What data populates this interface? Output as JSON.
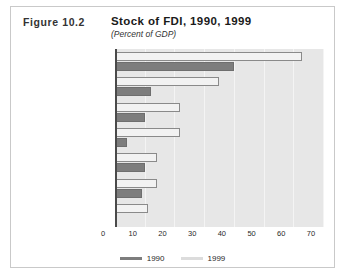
{
  "figure": {
    "number": "Figure 10.2",
    "title": "Stock of FDI, 1990, 1999",
    "subtitle": "(Percent of GDP)"
  },
  "legend": {
    "items": [
      {
        "label": "1990",
        "color": "#7d7d7d"
      },
      {
        "label": "1999",
        "color": "#dcdcdc"
      }
    ]
  },
  "axis": {
    "ticks": [
      "0",
      "10",
      "20",
      "30",
      "40",
      "50",
      "60",
      "70"
    ]
  },
  "chart_data": {
    "type": "bar",
    "orientation": "horizontal",
    "title": "Stock of FDI, 1990, 1999",
    "subtitle": "(Percent of GDP)",
    "xlabel": "",
    "ylabel": "",
    "xlim": [
      0,
      70
    ],
    "xticks": [
      0,
      10,
      20,
      30,
      40,
      50,
      60,
      70
    ],
    "grid": true,
    "legend_position": "bottom",
    "categories": [
      "East Asia",
      "Africa",
      "Latin America",
      "Rest of Asia",
      "Middle East",
      "Developed countries",
      "Eastern Europe"
    ],
    "series": [
      {
        "name": "1990",
        "color": "#7d7d7d",
        "values": [
          40,
          12,
          10,
          4,
          10,
          9,
          0.5
        ]
      },
      {
        "name": "1999",
        "color": "#f2f2f2",
        "values": [
          63,
          35,
          22,
          22,
          14,
          14,
          11
        ]
      }
    ]
  }
}
